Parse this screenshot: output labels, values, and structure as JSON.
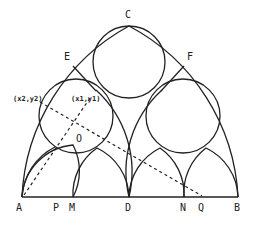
{
  "diagram": {
    "type": "geometry-construction",
    "stroke_color": "#222222",
    "background": "#ffffff",
    "points": {
      "A": "A",
      "P": "P",
      "M": "M",
      "D": "D",
      "N": "N",
      "Q": "Q",
      "B": "B",
      "C": "C",
      "E": "E",
      "F": "F",
      "O": "O"
    },
    "coordinate_labels": {
      "p1": "(x1,y1)",
      "p2": "(x2,y2)"
    }
  }
}
